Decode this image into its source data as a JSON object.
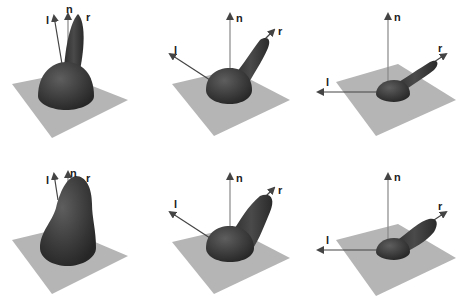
{
  "figure": {
    "colors": {
      "plane": "#b5b5b5",
      "lobe": "#3a3a3a",
      "lobe_highlight": "#5a5a5a",
      "arrow": "#444444",
      "label": "#222222"
    },
    "panels": [
      {
        "id": "top-1",
        "labels": {
          "l": "l",
          "n": "n",
          "r": "r"
        }
      },
      {
        "id": "top-2",
        "labels": {
          "l": "l",
          "n": "n",
          "r": "r"
        }
      },
      {
        "id": "top-3",
        "labels": {
          "l": "l",
          "n": "n",
          "r": "r"
        }
      },
      {
        "id": "bottom-1",
        "labels": {
          "l": "l",
          "n": "n",
          "r": "r"
        }
      },
      {
        "id": "bottom-2",
        "labels": {
          "l": "l",
          "n": "n",
          "r": "r"
        }
      },
      {
        "id": "bottom-3",
        "labels": {
          "l": "l",
          "n": "n",
          "r": "r"
        }
      }
    ]
  }
}
